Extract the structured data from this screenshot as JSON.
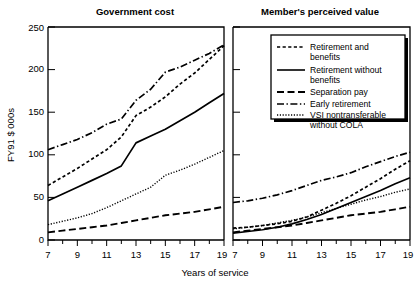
{
  "figure": {
    "x_axis_title": "Years of service",
    "y_axis_title": "FY91 $ 000s",
    "x_ticks": [
      "7",
      "9",
      "11",
      "13",
      "15",
      "17",
      "19"
    ],
    "y_ticks": [
      "0",
      "50",
      "100",
      "150",
      "200",
      "250"
    ]
  },
  "panels": [
    {
      "title": "Government cost"
    },
    {
      "title": "Member's perceived value"
    }
  ],
  "legend": {
    "entries": [
      {
        "label": "Retirement and benefits",
        "line": "dotted-dash",
        "id": "retirement-and-benefits"
      },
      {
        "label": "Retirement without benefits",
        "line": "solid",
        "id": "retirement-without-benefits"
      },
      {
        "label": "Separation pay",
        "line": "dashed",
        "id": "separation-pay"
      },
      {
        "label": "Early retirement",
        "line": "dash-dot",
        "id": "early-retirement"
      },
      {
        "label": "VSI nontransferable without COLA",
        "line": "fine-dotted",
        "id": "vsi-nontransferable-without-cola"
      }
    ]
  },
  "chart_data": {
    "type": "line",
    "title": "",
    "xlabel": "Years of service",
    "ylabel": "FY91 $ 000s",
    "xlim": [
      7,
      19
    ],
    "ylim": [
      0,
      250
    ],
    "xticks": [
      7,
      9,
      11,
      13,
      15,
      17,
      19
    ],
    "yticks": [
      0,
      50,
      100,
      150,
      200,
      250
    ],
    "grid": false,
    "legend_position": "top-right of right panel",
    "panels": [
      {
        "title": "Government cost",
        "x": [
          7,
          8,
          9,
          10,
          11,
          12,
          13,
          14,
          15,
          16,
          17,
          18,
          19
        ],
        "series": [
          {
            "name": "Retirement and benefits",
            "style": "dotted-dash",
            "values": [
              64,
              74,
              84,
              95,
              106,
              121,
              146,
              156,
              168,
              183,
              196,
              212,
              228
            ]
          },
          {
            "name": "Retirement without benefits",
            "style": "solid",
            "values": [
              46,
              54,
              62,
              70,
              78,
              87,
              114,
              122,
              130,
              140,
              150,
              161,
              172
            ]
          },
          {
            "name": "Separation pay",
            "style": "dashed",
            "values": [
              9,
              11,
              13,
              15,
              17,
              20,
              23,
              26,
              29,
              31,
              33,
              36,
              39
            ]
          },
          {
            "name": "Early retirement",
            "style": "dash-dot",
            "values": [
              106,
              112,
              118,
              126,
              136,
              142,
              164,
              177,
              197,
              203,
              211,
              219,
              229
            ]
          },
          {
            "name": "VSI nontransferable without COLA",
            "style": "fine-dotted",
            "values": [
              18,
              22,
              26,
              31,
              38,
              46,
              54,
              62,
              76,
              82,
              89,
              97,
              105
            ]
          }
        ]
      },
      {
        "title": "Member's perceived value",
        "x": [
          7,
          8,
          9,
          10,
          11,
          12,
          13,
          14,
          15,
          16,
          17,
          18,
          19
        ],
        "series": [
          {
            "name": "Retirement and benefits",
            "style": "dotted-dash",
            "values": [
              14,
              15,
              17,
              19,
              22,
              27,
              35,
              43,
              52,
              62,
              72,
              83,
              93
            ]
          },
          {
            "name": "Retirement without benefits",
            "style": "solid",
            "values": [
              8,
              10,
              12,
              15,
              19,
              24,
              30,
              37,
              44,
              51,
              58,
              66,
              73
            ]
          },
          {
            "name": "Separation pay",
            "style": "dashed",
            "values": [
              9,
              11,
              13,
              15,
              17,
              20,
              23,
              26,
              29,
              31,
              33,
              36,
              39
            ]
          },
          {
            "name": "Early retirement",
            "style": "dash-dot",
            "values": [
              44,
              46,
              49,
              53,
              58,
              64,
              70,
              74,
              79,
              86,
              92,
              98,
              103
            ]
          },
          {
            "name": "VSI nontransferable without COLA",
            "style": "fine-dotted",
            "values": [
              13,
              15,
              17,
              20,
              23,
              27,
              32,
              37,
              42,
              47,
              51,
              56,
              60
            ]
          }
        ]
      }
    ]
  }
}
